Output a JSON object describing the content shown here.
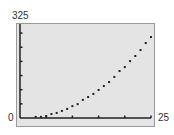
{
  "window": {
    "ymax_label": "325",
    "ymin_label": "0",
    "xmax_label": "25"
  },
  "colors": {
    "background": "#ffffff",
    "plot_background": "#e4e4e4",
    "frame": "#9a9a9a",
    "axis": "#222222",
    "point": "#222222"
  },
  "chart_data": {
    "type": "scatter",
    "title": "",
    "xlabel": "",
    "ylabel": "",
    "xlim": [
      0,
      25
    ],
    "ylim": [
      0,
      325
    ],
    "x_tick_interval": 5,
    "y_tick_interval": 50,
    "x_ticks": [
      5,
      10,
      15,
      20,
      25
    ],
    "y_ticks": [
      50,
      100,
      150,
      200,
      250,
      300
    ],
    "corner_labels": {
      "x_max": "25",
      "y_max": "325",
      "origin": "0"
    },
    "grid": false,
    "legend": null,
    "series": [
      {
        "name": "data",
        "x": [
          3,
          4,
          5,
          6,
          7,
          8,
          9,
          10,
          11,
          12,
          13,
          14,
          15,
          16,
          17,
          18,
          19,
          20,
          21,
          22,
          23,
          24,
          25
        ],
        "y": [
          4,
          4,
          7,
          14,
          18,
          25,
          32,
          42,
          49,
          64,
          74,
          85,
          99,
          113,
          127,
          145,
          166,
          180,
          201,
          219,
          240,
          265,
          286
        ]
      }
    ]
  }
}
